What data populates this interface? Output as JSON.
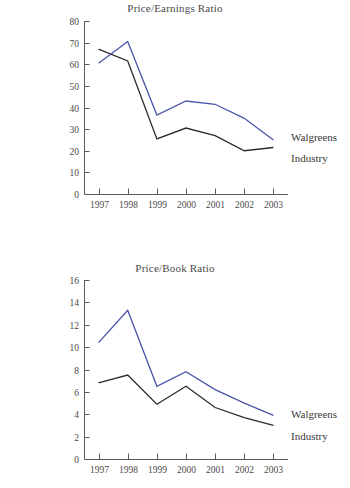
{
  "document": {
    "figure_count": 2,
    "series_colors": {
      "walgreens": "#4a55a8",
      "industry": "#2b2b2b"
    }
  },
  "charts": [
    {
      "id": "price-earnings-ratio",
      "title": "Price/Earnings Ratio",
      "legend": {
        "walgreens": "Walgreens",
        "industry": "Industry"
      },
      "y_ticks": [
        "0",
        "10",
        "20",
        "30",
        "40",
        "50",
        "60",
        "70",
        "80"
      ],
      "x_ticks": [
        "1997",
        "1998",
        "1999",
        "2000",
        "2001",
        "2002",
        "2003"
      ]
    },
    {
      "id": "price-book-ratio",
      "title": "Price/Book Ratio",
      "legend": {
        "walgreens": "Walgreens",
        "industry": "Industry"
      },
      "y_ticks": [
        "0",
        "2",
        "4",
        "6",
        "8",
        "10",
        "12",
        "14",
        "16"
      ],
      "x_ticks": [
        "1997",
        "1998",
        "1999",
        "2000",
        "2001",
        "2002",
        "2003"
      ]
    }
  ],
  "chart_data": [
    {
      "type": "line",
      "title": "Price/Earnings Ratio",
      "xlabel": "",
      "ylabel": "",
      "x": [
        "1997",
        "1998",
        "1999",
        "2000",
        "2001",
        "2002",
        "2003"
      ],
      "ylim": [
        0,
        80
      ],
      "ytick_step": 10,
      "grid": false,
      "legend_position": "right-of-line-ends",
      "series": [
        {
          "name": "Walgreens",
          "color": "#4a55a8",
          "values": [
            60.5,
            70.5,
            36.5,
            43.0,
            41.5,
            35.0,
            25.0
          ]
        },
        {
          "name": "Industry",
          "color": "#2b2b2b",
          "values": [
            67.0,
            61.5,
            25.5,
            30.5,
            27.0,
            20.0,
            21.5
          ]
        }
      ]
    },
    {
      "type": "line",
      "title": "Price/Book Ratio",
      "xlabel": "",
      "ylabel": "",
      "x": [
        "1997",
        "1998",
        "1999",
        "2000",
        "2001",
        "2002",
        "2003"
      ],
      "ylim": [
        0,
        16
      ],
      "ytick_step": 2,
      "grid": false,
      "legend_position": "right-of-line-ends",
      "series": [
        {
          "name": "Walgreens",
          "color": "#4a55a8",
          "values": [
            10.4,
            13.3,
            6.5,
            7.8,
            6.2,
            5.0,
            3.9
          ]
        },
        {
          "name": "Industry",
          "color": "#2b2b2b",
          "values": [
            6.8,
            7.5,
            4.9,
            6.5,
            4.6,
            3.7,
            3.0
          ]
        }
      ]
    }
  ]
}
